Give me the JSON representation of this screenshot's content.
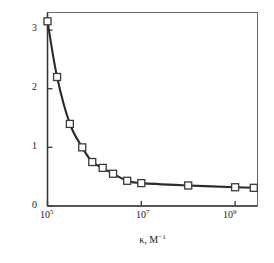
{
  "chart_data": {
    "type": "line",
    "title": "",
    "xlabel": "κ, M⁻¹",
    "ylabel": "Cᶜʳ · 10⁶, M",
    "xlabel_parts": {
      "symbol": "κ,",
      "unit_base": "M",
      "unit_exp": "−1"
    },
    "ylabel_parts": {
      "symbol": "C",
      "symbol_sup": "cr",
      "dot": "·",
      "factor_base": "10",
      "factor_exp": "6",
      "unit": ", M"
    },
    "xscale": "log",
    "yscale": "linear",
    "xlim": [
      100000,
      3000000000
    ],
    "ylim": [
      0,
      3.3
    ],
    "grid": false,
    "legend": null,
    "xticks": [
      100000,
      10000000,
      1000000000
    ],
    "xtick_labels": [
      "10⁵",
      "10⁷",
      "10⁹"
    ],
    "xtick_label_parts": [
      {
        "base": "10",
        "exp": "5"
      },
      {
        "base": "10",
        "exp": "7"
      },
      {
        "base": "10",
        "exp": "9"
      }
    ],
    "yticks": [
      0,
      1,
      2,
      3
    ],
    "ytick_labels": [
      "0",
      "1",
      "2",
      "3"
    ],
    "marker": "square-open",
    "marker_face_color": "#ffffff",
    "marker_edge_color": "#3a3a3a",
    "line_color": "#2b2b2b",
    "frame_color": "#6b6b6b",
    "axis_color": "#3a3a3a",
    "x": [
      100000,
      160000,
      300000,
      550000,
      900000,
      1500000,
      2500000,
      5000000,
      10000000,
      100000000,
      1000000000,
      2500000000
    ],
    "y": [
      3.15,
      2.2,
      1.4,
      1.0,
      0.75,
      0.65,
      0.55,
      0.43,
      0.39,
      0.35,
      0.32,
      0.31
    ],
    "series": [
      {
        "name": "critical concentration vs binding constant",
        "x": [
          100000,
          160000,
          300000,
          550000,
          900000,
          1500000,
          2500000,
          5000000,
          10000000,
          100000000,
          1000000000,
          2500000000
        ],
        "values": [
          3.15,
          2.2,
          1.4,
          1.0,
          0.75,
          0.65,
          0.55,
          0.43,
          0.39,
          0.35,
          0.32,
          0.31
        ]
      }
    ]
  }
}
